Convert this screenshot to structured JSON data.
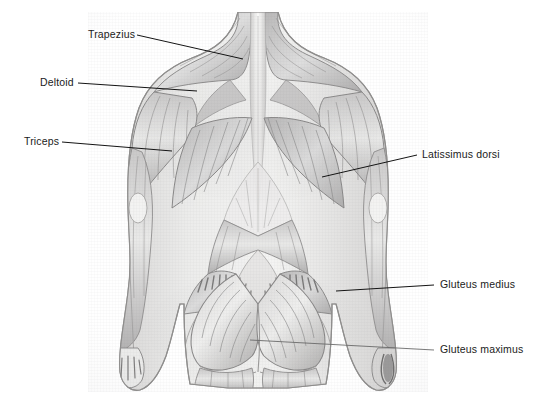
{
  "figure": {
    "view": "posterior",
    "medium": "pencil-and-wash anatomical illustration",
    "background_color": "#ffffff",
    "ink_color": "#1b1b1b"
  },
  "labels": [
    {
      "id": "trapezius",
      "text": "Trapezius",
      "side": "left",
      "text_x": 88,
      "text_y": 28,
      "leader": {
        "x1": 137,
        "y1": 35,
        "x2": 243,
        "y2": 59
      }
    },
    {
      "id": "deltoid",
      "text": "Deltoid",
      "side": "left",
      "text_x": 40,
      "text_y": 76,
      "leader": {
        "x1": 78,
        "y1": 83,
        "x2": 197,
        "y2": 91
      }
    },
    {
      "id": "triceps",
      "text": "Triceps",
      "side": "left",
      "text_x": 24,
      "text_y": 135,
      "leader": {
        "x1": 62,
        "y1": 142,
        "x2": 172,
        "y2": 151
      }
    },
    {
      "id": "latissimus-dorsi",
      "text": "Latissimus dorsi",
      "side": "right",
      "text_x": 422,
      "text_y": 148,
      "leader": {
        "x1": 417,
        "y1": 155,
        "x2": 322,
        "y2": 177
      }
    },
    {
      "id": "gluteus-medius",
      "text": "Gluteus medius",
      "side": "right",
      "text_x": 440,
      "text_y": 278,
      "leader": {
        "x1": 434,
        "y1": 285,
        "x2": 336,
        "y2": 291
      }
    },
    {
      "id": "gluteus-maximus",
      "text": "Gluteus maximus",
      "side": "right",
      "text_x": 440,
      "text_y": 343,
      "leader": {
        "x1": 434,
        "y1": 350,
        "x2": 378,
        "y2": 348
      }
    }
  ],
  "muscle_groups": [
    "Trapezius",
    "Deltoid",
    "Triceps",
    "Latissimus dorsi",
    "Gluteus medius",
    "Gluteus maximus"
  ]
}
